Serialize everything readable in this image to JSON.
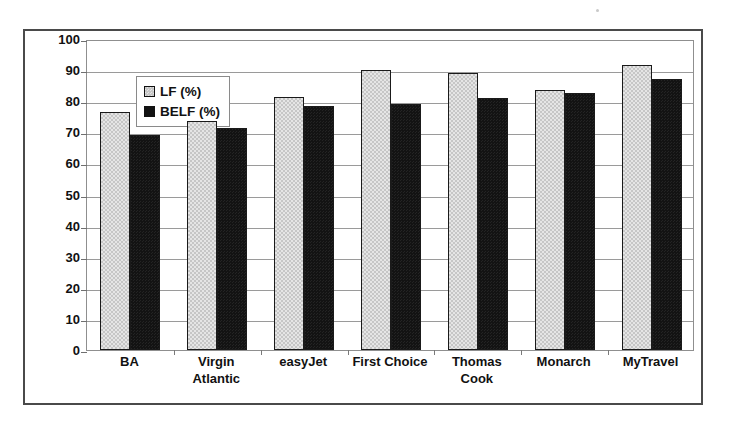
{
  "chart_data": {
    "type": "bar",
    "title": "",
    "subtitle": "",
    "xlabel": "",
    "ylabel": "",
    "ylim": [
      0,
      100
    ],
    "ytick_step": 10,
    "yticks": [
      0,
      10,
      20,
      30,
      40,
      50,
      60,
      70,
      80,
      90,
      100
    ],
    "grid": true,
    "legend_position": "upper-left-inside",
    "categories": [
      "BA",
      "Virgin Atlantic",
      "easyJet",
      "First Choice",
      "Thomas Cook",
      "Monarch",
      "MyTravel"
    ],
    "category_lines": [
      [
        "BA"
      ],
      [
        "Virgin",
        "Atlantic"
      ],
      [
        "easyJet"
      ],
      [
        "First Choice"
      ],
      [
        "Thomas",
        "Cook"
      ],
      [
        "Monarch"
      ],
      [
        "MyTravel"
      ]
    ],
    "series": [
      {
        "name": "LF (%)",
        "color": "#c6c6c6",
        "values": [
          76.5,
          73.5,
          81.5,
          90.0,
          89.0,
          83.5,
          91.5
        ]
      },
      {
        "name": "BELF (%)",
        "color": "#131313",
        "values": [
          69.0,
          71.5,
          78.5,
          79.0,
          81.0,
          82.5,
          87.0
        ]
      }
    ]
  },
  "legend": {
    "items": [
      {
        "label": "LF (%)",
        "swatch": "light-gray-swatch"
      },
      {
        "label": "BELF (%)",
        "swatch": "black-swatch"
      }
    ]
  },
  "colors": {
    "lf_bar": "#c6c6c6",
    "belf_bar": "#131313",
    "gridline": "#9a9a9a",
    "frame": "#4a4a4a",
    "text": "#111111",
    "background": "#ffffff"
  }
}
